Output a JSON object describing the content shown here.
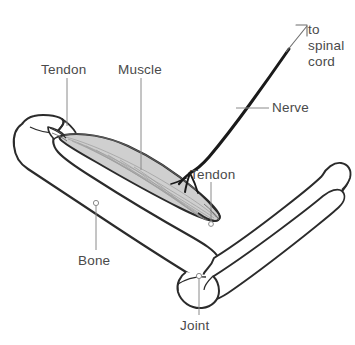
{
  "figure": {
    "type": "anatomical-diagram",
    "background_color": "#ffffff",
    "line_color": "#2b2b2b",
    "label_color": "#4a4a4a",
    "muscle_fill_color": "#cfcfcf",
    "leader_color": "#8a8a8a",
    "nerve_color": "#1a1a1a"
  },
  "labels": {
    "tendon_proximal": "Tendon",
    "muscle": "Muscle",
    "tendon_distal": "Tendon",
    "bone": "Bone",
    "joint": "Joint",
    "nerve": "Nerve",
    "to_spinal_cord": {
      "line1": "to",
      "line2": "spinal",
      "line3": "cord"
    }
  }
}
